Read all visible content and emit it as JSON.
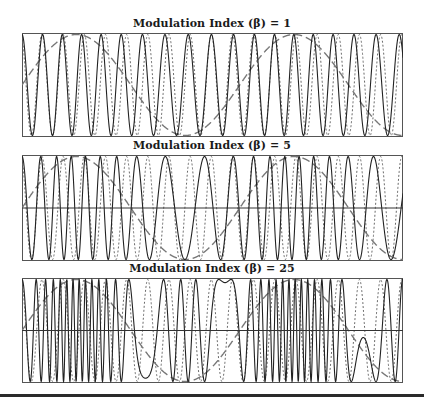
{
  "figure": {
    "legend_styles": {
      "fm_signal": "solid",
      "carrier": "dotted",
      "modulating_signal": "long-dash"
    }
  },
  "panels": [
    {
      "title": "Modulation Index (β) = 1",
      "beta": 1,
      "zero_line": false
    },
    {
      "title": "Modulation Index (β) = 5",
      "beta": 5,
      "zero_line": true
    },
    {
      "title": "Modulation Index (β) = 25",
      "beta": 25,
      "zero_line": true
    }
  ],
  "chart_data": [
    {
      "type": "line",
      "title": "Modulation Index (β) = 1",
      "xlabel": "",
      "ylabel": "",
      "ylim": [
        -1,
        1
      ],
      "grid": false,
      "series": [
        {
          "name": "FM signal",
          "style": "solid",
          "carrier_cycles": 18,
          "beta": 1
        },
        {
          "name": "Carrier",
          "style": "dotted",
          "carrier_cycles": 18
        },
        {
          "name": "Modulating signal",
          "style": "dashed",
          "cycles": 1.75,
          "phase_start": "mid-rising"
        }
      ]
    },
    {
      "type": "line",
      "title": "Modulation Index (β) = 5",
      "xlabel": "",
      "ylabel": "",
      "ylim": [
        -1,
        1
      ],
      "grid": false,
      "zero_line": true,
      "series": [
        {
          "name": "FM signal",
          "style": "solid",
          "carrier_cycles": 18,
          "beta": 5
        },
        {
          "name": "Carrier",
          "style": "dotted",
          "carrier_cycles": 18
        },
        {
          "name": "Modulating signal",
          "style": "dashed",
          "cycles": 1.75,
          "phase_start": "mid-rising"
        }
      ]
    },
    {
      "type": "line",
      "title": "Modulation Index (β) = 25",
      "xlabel": "",
      "ylabel": "",
      "ylim": [
        -1,
        1
      ],
      "grid": false,
      "zero_line": true,
      "series": [
        {
          "name": "FM signal",
          "style": "solid",
          "carrier_cycles": 18,
          "beta": 25
        },
        {
          "name": "Carrier",
          "style": "dotted",
          "carrier_cycles": 18
        },
        {
          "name": "Modulating signal",
          "style": "dashed",
          "cycles": 1.75,
          "phase_start": "mid-rising"
        }
      ]
    }
  ]
}
